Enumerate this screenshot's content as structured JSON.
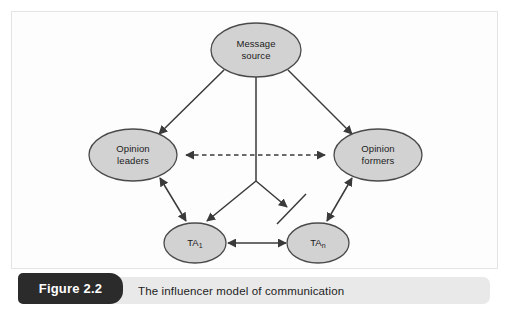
{
  "figure": {
    "number_label": "Figure 2.2",
    "caption": "The influencer model of communication"
  },
  "colors": {
    "node_fill": "#d2d2d2",
    "node_stroke": "#4a4a4a",
    "edge": "#3a3a3a",
    "caption_bar": "#e9e9e9",
    "caption_tag": "#2b2b2b",
    "caption_tag_text": "#ffffff",
    "text": "#1c1c1c",
    "background": "#ffffff"
  },
  "diagram": {
    "type": "node-link-diagram",
    "nodes": [
      {
        "id": "message_source",
        "label_line1": "Message",
        "label_line2": "source",
        "shape": "ellipse",
        "cx": 256,
        "cy": 50,
        "rx": 45,
        "ry": 27
      },
      {
        "id": "opinion_leaders",
        "label_line1": "Opinion",
        "label_line2": "leaders",
        "shape": "ellipse",
        "cx": 133,
        "cy": 155,
        "rx": 44,
        "ry": 26
      },
      {
        "id": "opinion_formers",
        "label_line1": "Opinion",
        "label_line2": "formers",
        "shape": "ellipse",
        "cx": 378,
        "cy": 155,
        "rx": 44,
        "ry": 26
      },
      {
        "id": "ta_1",
        "label_line1": "TA",
        "label_sub": "1",
        "shape": "ellipse",
        "cx": 195,
        "cy": 243,
        "rx": 31,
        "ry": 20
      },
      {
        "id": "ta_n",
        "label_line1": "TA",
        "label_sub": "n",
        "shape": "ellipse",
        "cx": 318,
        "cy": 243,
        "rx": 31,
        "ry": 20
      }
    ],
    "edges": [
      {
        "from": "message_source",
        "to": "opinion_leaders",
        "style": "solid",
        "arrows": "single"
      },
      {
        "from": "message_source",
        "to": "opinion_formers",
        "style": "solid",
        "arrows": "single"
      },
      {
        "from": "message_source",
        "to": "ta_1",
        "style": "solid",
        "arrows": "single",
        "via": "junction"
      },
      {
        "from": "message_source",
        "to": "ta_n",
        "style": "solid",
        "arrows": "single",
        "via": "junction",
        "blocked": true
      },
      {
        "from": "opinion_leaders",
        "to": "opinion_formers",
        "style": "dashed",
        "arrows": "double"
      },
      {
        "from": "opinion_leaders",
        "to": "ta_1",
        "style": "solid",
        "arrows": "double"
      },
      {
        "from": "opinion_formers",
        "to": "ta_n",
        "style": "solid",
        "arrows": "double"
      },
      {
        "from": "ta_1",
        "to": "ta_n",
        "style": "solid",
        "arrows": "double"
      }
    ],
    "annotations": [
      {
        "id": "blocked_path_slash",
        "meaning": "blocked path",
        "on_edge": "message_source -> ta_n"
      }
    ]
  }
}
